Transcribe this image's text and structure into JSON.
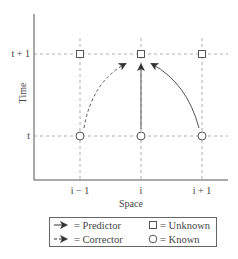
{
  "diagram": {
    "type": "predictor-corrector stencil",
    "axes": {
      "x_label": "Space",
      "y_label": "Time",
      "x_ticks": [
        "i − 1",
        "i",
        "i + 1"
      ],
      "y_ticks": [
        "t",
        "t + 1"
      ]
    },
    "nodes": [
      {
        "col": "i − 1",
        "row": "t + 1",
        "shape": "square",
        "meaning": "Unknown"
      },
      {
        "col": "i",
        "row": "t + 1",
        "shape": "square",
        "meaning": "Unknown"
      },
      {
        "col": "i + 1",
        "row": "t + 1",
        "shape": "square",
        "meaning": "Unknown"
      },
      {
        "col": "i − 1",
        "row": "t",
        "shape": "circle",
        "meaning": "Known"
      },
      {
        "col": "i",
        "row": "t",
        "shape": "circle",
        "meaning": "Known"
      },
      {
        "col": "i + 1",
        "row": "t",
        "shape": "circle",
        "meaning": "Known"
      }
    ],
    "edges": [
      {
        "from": "(i − 1, t)",
        "to": "(i, t + 1)",
        "style": "dashed",
        "meaning": "Corrector"
      },
      {
        "from": "(i, t)",
        "to": "(i, t + 1)",
        "style": "solid",
        "meaning": "Predictor"
      },
      {
        "from": "(i + 1, t)",
        "to": "(i, t + 1)",
        "style": "solid",
        "meaning": "Predictor"
      }
    ],
    "legend": {
      "predictor": "= Predictor",
      "corrector": "= Corrector",
      "unknown": "= Unknown",
      "known": "= Known"
    },
    "colors": {
      "line": "#555555",
      "grid": "#999999",
      "text": "#444444"
    }
  }
}
